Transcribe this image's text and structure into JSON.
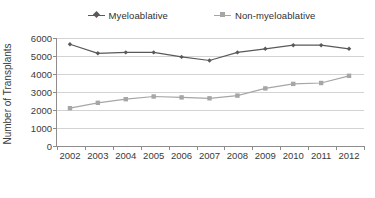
{
  "chart_data": {
    "type": "line",
    "title": "",
    "xlabel": "",
    "ylabel": "Number of Transplants",
    "categories": [
      "2002",
      "2003",
      "2004",
      "2005",
      "2006",
      "2007",
      "2008",
      "2009",
      "2010",
      "2011",
      "2012"
    ],
    "ylim": [
      0,
      6000
    ],
    "yticks": [
      0,
      1000,
      2000,
      3000,
      4000,
      5000,
      6000
    ],
    "ytick_labels": [
      "0",
      "1000",
      "2000",
      "3000",
      "4000",
      "5000",
      "6000"
    ],
    "grid": true,
    "legend_position": "top-center",
    "series": [
      {
        "name": "Myeloablative",
        "color": "#595959",
        "marker": "diamond",
        "values": [
          5650,
          5150,
          5200,
          5200,
          4950,
          4750,
          5200,
          5400,
          5600,
          5600,
          5400
        ]
      },
      {
        "name": "Non-myeloablative",
        "color": "#a6a6a6",
        "marker": "square",
        "values": [
          2100,
          2400,
          2600,
          2750,
          2700,
          2650,
          2800,
          3200,
          3450,
          3500,
          3900
        ]
      }
    ]
  },
  "legend": {
    "items": [
      {
        "label": "Myeloablative",
        "marker": "diamond-marker-icon",
        "color": "#595959"
      },
      {
        "label": "Non-myeloablative",
        "marker": "square-marker-icon",
        "color": "#a6a6a6"
      }
    ]
  },
  "colors": {
    "myeloablative": "#595959",
    "non_myeloablative": "#a6a6a6",
    "axis": "#8d8d8d",
    "grid": "#d3d3d3",
    "text": "#3a3a3a",
    "background": "#ffffff"
  }
}
